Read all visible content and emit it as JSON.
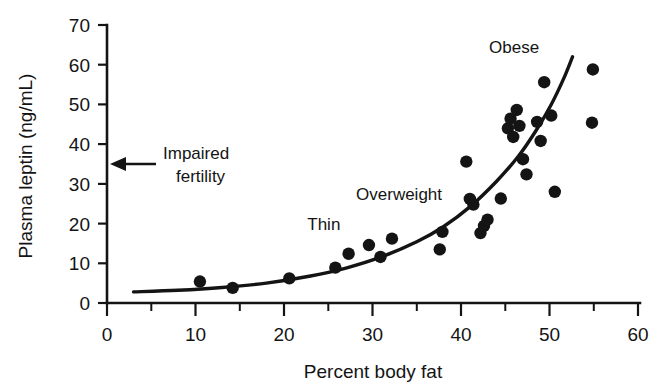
{
  "chart_data": {
    "type": "scatter",
    "title": "",
    "xlabel": "Percent body fat",
    "ylabel": "Plasma leptin (ng/mL)",
    "xlim": [
      0,
      60
    ],
    "ylim": [
      0,
      70
    ],
    "xticks": [
      0,
      10,
      20,
      30,
      40,
      50,
      60
    ],
    "xtick_labels": [
      "0",
      "10",
      "20",
      "30",
      "40",
      "50",
      "60"
    ],
    "xminor_ticks": [
      5,
      15,
      25,
      35,
      45,
      55
    ],
    "yticks": [
      0,
      10,
      20,
      30,
      40,
      50,
      60,
      70
    ],
    "ytick_labels": [
      "0",
      "10",
      "20",
      "30",
      "40",
      "50",
      "60",
      "70"
    ],
    "grid": false,
    "legend": "none",
    "series": [
      {
        "name": "Individual subjects",
        "marker": "filled-circle",
        "color": "#141414",
        "points": [
          [
            10.5,
            5.4
          ],
          [
            14.2,
            3.8
          ],
          [
            20.6,
            6.2
          ],
          [
            25.8,
            8.9
          ],
          [
            27.3,
            12.4
          ],
          [
            29.6,
            14.6
          ],
          [
            30.9,
            11.6
          ],
          [
            32.2,
            16.2
          ],
          [
            37.6,
            13.5
          ],
          [
            37.9,
            17.9
          ],
          [
            40.6,
            35.6
          ],
          [
            41.0,
            26.2
          ],
          [
            41.4,
            24.8
          ],
          [
            42.2,
            17.6
          ],
          [
            42.6,
            19.4
          ],
          [
            43.0,
            21.0
          ],
          [
            44.5,
            26.3
          ],
          [
            45.3,
            44.0
          ],
          [
            45.6,
            46.4
          ],
          [
            45.9,
            41.8
          ],
          [
            46.3,
            48.6
          ],
          [
            46.6,
            44.6
          ],
          [
            47.0,
            36.2
          ],
          [
            47.4,
            32.4
          ],
          [
            48.6,
            45.6
          ],
          [
            49.0,
            40.8
          ],
          [
            49.4,
            55.6
          ],
          [
            50.2,
            47.2
          ],
          [
            50.6,
            28.0
          ],
          [
            54.8,
            45.4
          ],
          [
            54.9,
            58.8
          ]
        ]
      }
    ],
    "fit_curve": {
      "name": "Exponential trend line",
      "color": "#141414",
      "points": [
        [
          3.0,
          2.8
        ],
        [
          8.0,
          3.2
        ],
        [
          13.0,
          3.9
        ],
        [
          18.0,
          5.0
        ],
        [
          23.0,
          6.8
        ],
        [
          27.0,
          8.8
        ],
        [
          31.0,
          11.6
        ],
        [
          35.0,
          15.4
        ],
        [
          38.0,
          19.2
        ],
        [
          41.0,
          24.2
        ],
        [
          44.0,
          30.6
        ],
        [
          46.5,
          37.0
        ],
        [
          48.5,
          43.5
        ],
        [
          50.2,
          50.0
        ],
        [
          51.6,
          56.5
        ],
        [
          52.6,
          62.0
        ]
      ]
    },
    "annotations": [
      {
        "name": "thin",
        "text": "Thin",
        "x": 24.5,
        "y": 18.5
      },
      {
        "name": "overweight",
        "text": "Overweight",
        "x": 33.0,
        "y": 26.0
      },
      {
        "name": "obese",
        "text": "Obese",
        "x": 46.0,
        "y": 63.0
      },
      {
        "name": "impaired-fertility",
        "text_line1": "Impaired",
        "text_line2": "fertility",
        "points_to_y": 35.0
      }
    ]
  },
  "axes": {
    "x_axis_title": "Percent body fat",
    "y_axis_title": "Plasma leptin (ng/mL)"
  },
  "colors": {
    "ink": "#141414",
    "background": "#ffffff",
    "marker": "#141414",
    "curve": "#141414"
  },
  "markers": {
    "impaired_fertility_icon": "left-arrow-icon"
  }
}
